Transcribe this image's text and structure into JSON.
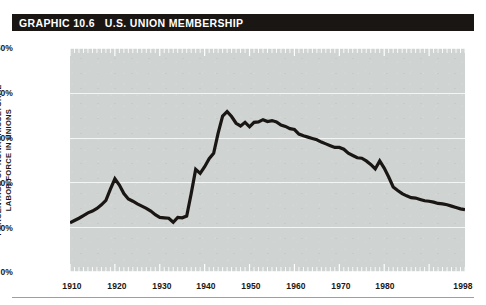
{
  "banner": {
    "label": "GRAPHIC 10.6   U.S. UNION MEMBERSHIP",
    "background_color": "#1a1614",
    "text_color": "#ffffff"
  },
  "axis": {
    "y_label_line1": "PERCENTAGE OF NONAGRICULTURAL",
    "y_label_line2": "LABOR FORCE IN UNIONS",
    "y_ticks": [
      "50%",
      "40%",
      "30%",
      "20%",
      "10%",
      "0%"
    ],
    "x_ticks": [
      "1910",
      "1920",
      "1930",
      "1940",
      "1950",
      "1960",
      "1970",
      "1980",
      "1998"
    ]
  },
  "colors": {
    "plot_background": "#cfd3d2",
    "gridline": "#f4f6f6",
    "line": "#1a1614",
    "page_background": "#ffffff",
    "rule": "#9aa0a0"
  },
  "chart_data": {
    "type": "line",
    "title": "GRAPHIC 10.6   U.S. UNION MEMBERSHIP",
    "xlabel": "",
    "ylabel": "PERCENTAGE OF NONAGRICULTURAL LABOR FORCE IN UNIONS",
    "xlim": [
      1910,
      1998
    ],
    "ylim": [
      0,
      50
    ],
    "yticks": [
      0,
      10,
      20,
      30,
      40,
      50
    ],
    "ytick_labels": [
      "0%",
      "10%",
      "20%",
      "30%",
      "40%",
      "50%"
    ],
    "xticks": [
      1910,
      1920,
      1930,
      1940,
      1950,
      1960,
      1970,
      1980,
      1998
    ],
    "xtick_labels": [
      "1910",
      "1920",
      "1930",
      "1940",
      "1950",
      "1960",
      "1970",
      "1980",
      "1998"
    ],
    "grid": "horizontal",
    "legend": "none",
    "series": [
      {
        "name": "Percentage of nonagricultural labor force in unions",
        "color": "#1a1614",
        "x": [
          1910,
          1911,
          1912,
          1913,
          1914,
          1915,
          1916,
          1917,
          1918,
          1919,
          1920,
          1921,
          1922,
          1923,
          1924,
          1925,
          1926,
          1927,
          1928,
          1929,
          1930,
          1931,
          1932,
          1933,
          1934,
          1935,
          1936,
          1937,
          1938,
          1939,
          1940,
          1941,
          1942,
          1943,
          1944,
          1945,
          1946,
          1947,
          1948,
          1949,
          1950,
          1951,
          1952,
          1953,
          1954,
          1955,
          1956,
          1957,
          1958,
          1959,
          1960,
          1961,
          1962,
          1963,
          1964,
          1965,
          1966,
          1967,
          1968,
          1969,
          1970,
          1971,
          1972,
          1973,
          1974,
          1975,
          1976,
          1977,
          1978,
          1979,
          1980,
          1981,
          1982,
          1983,
          1984,
          1985,
          1986,
          1987,
          1988,
          1989,
          1990,
          1991,
          1992,
          1993,
          1994,
          1995,
          1996,
          1997,
          1998
        ],
        "y": [
          11.0,
          11.5,
          12.0,
          12.6,
          13.2,
          13.6,
          14.2,
          15.0,
          16.0,
          18.5,
          20.8,
          19.4,
          17.5,
          16.3,
          15.8,
          15.2,
          14.7,
          14.2,
          13.6,
          12.8,
          12.2,
          12.1,
          12.0,
          11.1,
          12.2,
          12.1,
          12.5,
          17.5,
          22.9,
          22.0,
          23.5,
          25.3,
          26.5,
          31.0,
          34.8,
          35.8,
          34.7,
          33.2,
          32.6,
          33.4,
          32.4,
          33.4,
          33.5,
          34.0,
          33.6,
          33.8,
          33.5,
          32.8,
          32.5,
          32.0,
          31.8,
          30.8,
          30.4,
          30.1,
          29.8,
          29.5,
          29.0,
          28.6,
          28.2,
          27.8,
          27.8,
          27.4,
          26.5,
          26.0,
          25.5,
          25.4,
          24.8,
          24.0,
          23.0,
          24.8,
          23.2,
          21.2,
          19.0,
          18.2,
          17.5,
          17.0,
          16.6,
          16.5,
          16.2,
          15.9,
          15.8,
          15.6,
          15.3,
          15.2,
          15.0,
          14.7,
          14.4,
          14.1,
          13.9
        ]
      }
    ]
  }
}
